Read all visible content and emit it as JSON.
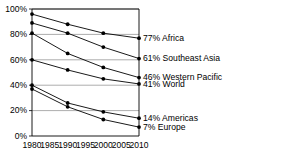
{
  "chart_data": {
    "type": "line",
    "title": "",
    "xlabel": "",
    "ylabel": "",
    "x": [
      1980,
      1985,
      1990,
      1995,
      2000,
      2005,
      2010
    ],
    "xlim": [
      1980,
      2010
    ],
    "ylim": [
      0,
      100
    ],
    "yticks": [
      "0%",
      "20%",
      "40%",
      "60%",
      "80%",
      "100%"
    ],
    "ytick_values": [
      0,
      20,
      40,
      60,
      80,
      100
    ],
    "xticks": [
      "1980",
      "1985",
      "1990",
      "1995",
      "2000",
      "2005",
      "2010"
    ],
    "grid": true,
    "legend_position": "right-inline",
    "value_suffix": "%",
    "series": [
      {
        "name": "Africa",
        "end_label": "77% Africa",
        "end_value": 77,
        "x": [
          1980,
          1990,
          2000,
          2010
        ],
        "values": [
          96,
          88,
          81,
          77
        ],
        "markers": [
          1980,
          1990,
          2000,
          2010
        ]
      },
      {
        "name": "Southeast Asia",
        "end_label": "61% Southeast Asia",
        "end_value": 61,
        "x": [
          1980,
          1990,
          2000,
          2010
        ],
        "values": [
          89,
          81,
          70,
          61
        ],
        "markers": [
          1980,
          1990,
          2000,
          2010
        ]
      },
      {
        "name": "Western Pacific",
        "end_label": "46% Western Pacific",
        "end_value": 46,
        "x": [
          1980,
          1990,
          2000,
          2010
        ],
        "values": [
          81,
          65,
          54,
          46
        ],
        "markers": [
          1980,
          1990,
          2000,
          2010
        ]
      },
      {
        "name": "World",
        "end_label": "41% World",
        "end_value": 41,
        "x": [
          1980,
          1990,
          2000,
          2010
        ],
        "values": [
          60,
          52,
          45,
          41
        ],
        "markers": [
          1980,
          1990,
          2000,
          2010
        ]
      },
      {
        "name": "Americas",
        "end_label": "14% Americas",
        "end_value": 14,
        "x": [
          1980,
          1990,
          2000,
          2010
        ],
        "values": [
          40,
          26,
          19,
          14
        ],
        "markers": [
          1980,
          1990,
          2000,
          2010
        ]
      },
      {
        "name": "Europe",
        "end_label": "7% Europe",
        "end_value": 7,
        "x": [
          1980,
          1990,
          2000,
          2010
        ],
        "values": [
          37,
          23,
          13,
          7
        ],
        "markers": [
          1980,
          1990,
          2000,
          2010
        ]
      }
    ]
  },
  "colors": {
    "line": "#000000",
    "grid": "#8a8a8a",
    "axis": "#000000",
    "background": "#ffffff"
  }
}
